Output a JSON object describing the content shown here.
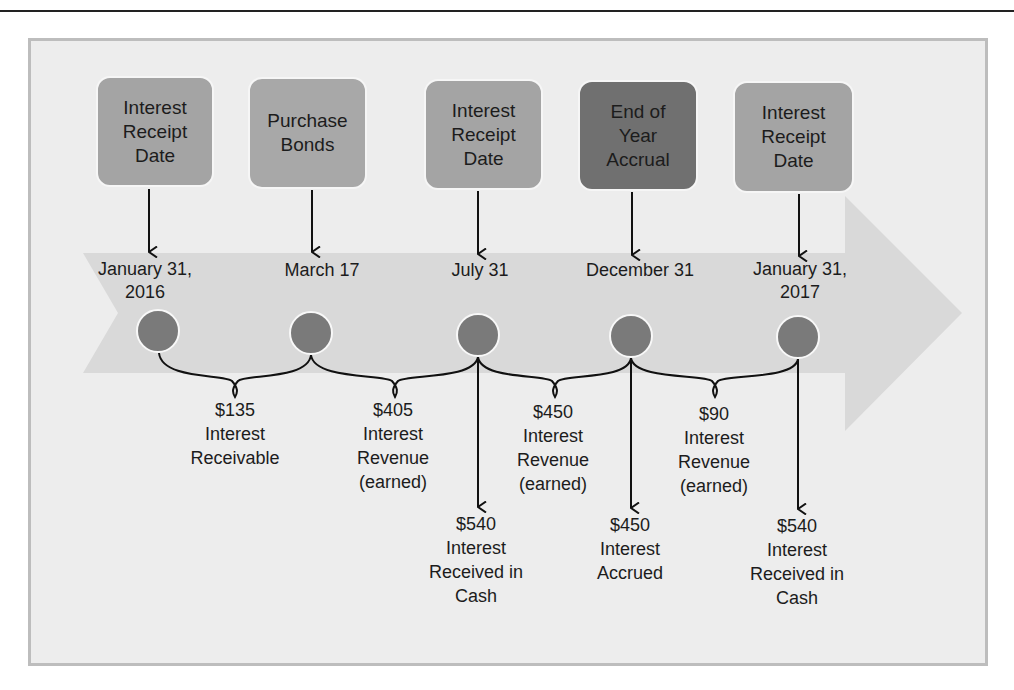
{
  "colors": {
    "frame_bg": "#ededed",
    "frame_border": "#bdbdbd",
    "timeline_band": "#d9d9d9",
    "box_light": "#a4a4a4",
    "box_medium": "#999999",
    "box_dark": "#6f6f6f",
    "milestone_dot": "#7a7a7a"
  },
  "events": [
    {
      "box_label": "Interest\nReceipt\nDate",
      "date_label": "January 31,\n2016",
      "shade": "box_light"
    },
    {
      "box_label": "Purchase\nBonds",
      "date_label": "March 17",
      "shade": "box_light"
    },
    {
      "box_label": "Interest\nReceipt\nDate",
      "date_label": "July 31",
      "shade": "box_light"
    },
    {
      "box_label": "End of\nYear\nAccrual",
      "date_label": "December 31",
      "shade": "box_dark"
    },
    {
      "box_label": "Interest\nReceipt\nDate",
      "date_label": "January 31,\n2017",
      "shade": "box_light"
    }
  ],
  "periods": [
    {
      "amount": "$135",
      "text": "Interest\nReceivable"
    },
    {
      "amount": "$405",
      "text": "Interest\nRevenue\n(earned)"
    },
    {
      "amount": "$450",
      "text": "Interest\nRevenue\n(earned)"
    },
    {
      "amount": "$90",
      "text": "Interest\nRevenue\n(earned)"
    }
  ],
  "outcomes": [
    {
      "amount": "$540",
      "text": "Interest\nReceived in\nCash"
    },
    {
      "amount": "$450",
      "text": "Interest\nAccrued"
    },
    {
      "amount": "$540",
      "text": "Interest\nReceived in\nCash"
    }
  ]
}
